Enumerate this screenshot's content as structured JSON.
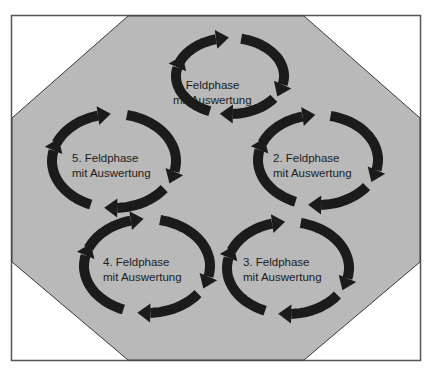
{
  "diagram": {
    "type": "cycle-of-cycles",
    "colors": {
      "background": "#ffffff",
      "frame_border": "#555555",
      "octagon_fill": "#b9b9b9",
      "octagon_border": "#3a3a3a",
      "arrow": "#1b1b1b",
      "text": "#1c1c1c"
    },
    "cycles": [
      {
        "id": 1,
        "line1": "1. Feldphase",
        "line2": "mit Auswertung",
        "cx": 230,
        "cy": 76,
        "rx": 54,
        "ry": 38,
        "text_x": 173,
        "text_y": 78
      },
      {
        "id": 2,
        "line1": "2. Feldphase",
        "line2": "mit Auswertung",
        "cx": 318,
        "cy": 160,
        "rx": 60,
        "ry": 45,
        "text_x": 273,
        "text_y": 151
      },
      {
        "id": 3,
        "line1": "3. Feldphase",
        "line2": "mit Auswertung",
        "cx": 288,
        "cy": 268,
        "rx": 61,
        "ry": 46,
        "text_x": 243,
        "text_y": 255
      },
      {
        "id": 4,
        "line1": "4. Feldphase",
        "line2": "mit Auswertung",
        "cx": 147,
        "cy": 266,
        "rx": 63,
        "ry": 47,
        "text_x": 103,
        "text_y": 255
      },
      {
        "id": 5,
        "line1": "5. Feldphase",
        "line2": "mit Auswertung",
        "cx": 114,
        "cy": 161,
        "rx": 62,
        "ry": 47,
        "text_x": 72,
        "text_y": 151
      }
    ]
  }
}
